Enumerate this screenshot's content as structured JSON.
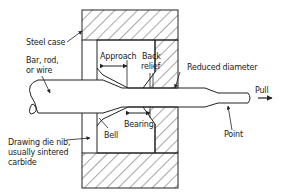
{
  "diagram": {
    "labels": {
      "steel_case": "Steel case",
      "bar_rod_wire_1": "Bar, rod,",
      "bar_rod_wire_2": "or wire",
      "approach": "Approach",
      "back_relief_1": "Back",
      "back_relief_2": "relief",
      "reduced_diameter": "Reduced diameter",
      "pull": "Pull",
      "bearing": "Bearing",
      "bell": "Bell",
      "point": "Point",
      "nib_1": "Drawing die nib,",
      "nib_2": "usually sintered",
      "nib_3": "carbide"
    },
    "colors": {
      "line": "#222222",
      "background": "#ffffff"
    }
  }
}
